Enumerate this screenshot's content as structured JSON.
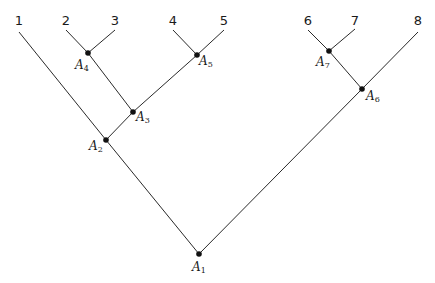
{
  "diagram": {
    "type": "binary-tree",
    "leaves": [
      {
        "id": "1",
        "label": "1"
      },
      {
        "id": "2",
        "label": "2"
      },
      {
        "id": "3",
        "label": "3"
      },
      {
        "id": "4",
        "label": "4"
      },
      {
        "id": "5",
        "label": "5"
      },
      {
        "id": "6",
        "label": "6"
      },
      {
        "id": "7",
        "label": "7"
      },
      {
        "id": "8",
        "label": "8"
      }
    ],
    "internal_nodes": [
      {
        "id": "A1",
        "base": "A",
        "sub": "1"
      },
      {
        "id": "A2",
        "base": "A",
        "sub": "2"
      },
      {
        "id": "A3",
        "base": "A",
        "sub": "3"
      },
      {
        "id": "A4",
        "base": "A",
        "sub": "4"
      },
      {
        "id": "A5",
        "base": "A",
        "sub": "5"
      },
      {
        "id": "A6",
        "base": "A",
        "sub": "6"
      },
      {
        "id": "A7",
        "base": "A",
        "sub": "7"
      }
    ],
    "edges": [
      [
        "A1",
        "A2"
      ],
      [
        "A1",
        "A6"
      ],
      [
        "A2",
        "1"
      ],
      [
        "A2",
        "A3"
      ],
      [
        "A3",
        "A4"
      ],
      [
        "A3",
        "A5"
      ],
      [
        "A4",
        "2"
      ],
      [
        "A4",
        "3"
      ],
      [
        "A5",
        "4"
      ],
      [
        "A5",
        "5"
      ],
      [
        "A6",
        "A7"
      ],
      [
        "A6",
        "8"
      ],
      [
        "A7",
        "6"
      ],
      [
        "A7",
        "7"
      ]
    ],
    "root": "A1"
  }
}
